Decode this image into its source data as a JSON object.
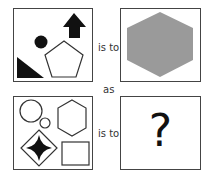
{
  "puzzle": {
    "type": "visual analogy",
    "row1": {
      "left_box": {
        "shapes": [
          "black-right-triangle",
          "black-circle",
          "white-pentagon",
          "black-up-arrow"
        ]
      },
      "connector": "is to",
      "right_box": {
        "shapes": [
          "gray-hexagon"
        ]
      }
    },
    "middle_connector": "as",
    "row2": {
      "left_box": {
        "shapes": [
          "white-large-circle",
          "white-small-circle",
          "white-hexagon",
          "diamond-with-black-four-point-star",
          "white-rectangle"
        ]
      },
      "connector": "is to",
      "right_box": {
        "symbol": "?"
      }
    }
  },
  "colors": {
    "border": "#444444",
    "fill_black": "#111111",
    "fill_gray": "#999999"
  }
}
